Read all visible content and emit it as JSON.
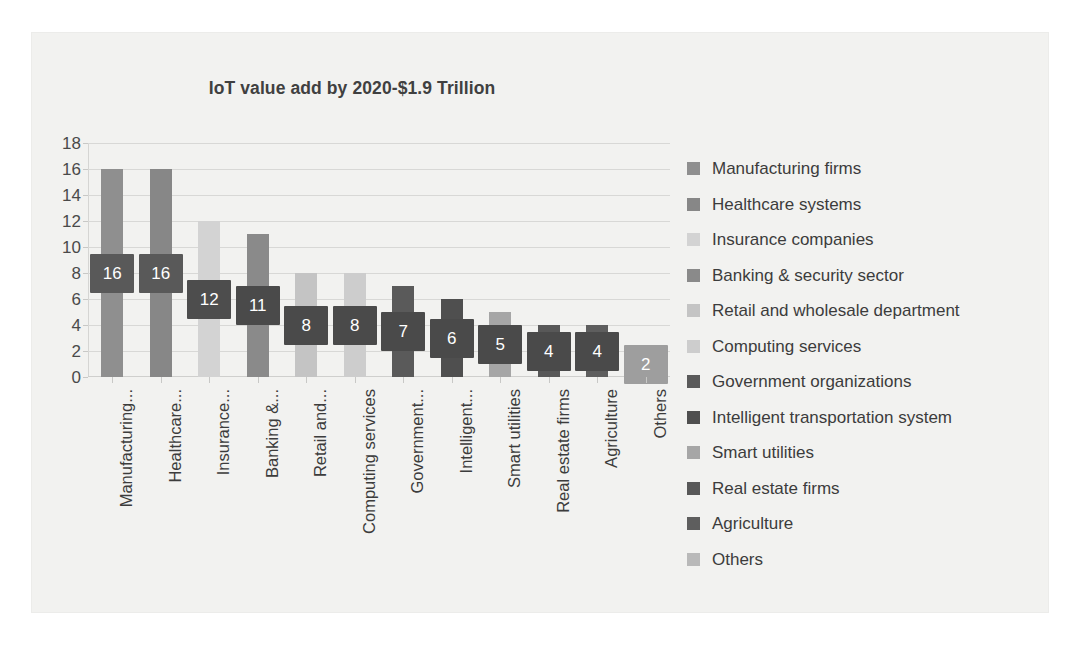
{
  "chart_data": {
    "type": "bar",
    "title": "IoT value add by 2020-$1.9 Trillion",
    "xlabel": "",
    "ylabel": "",
    "ylim": [
      0,
      18
    ],
    "y_ticks": [
      0,
      2,
      4,
      6,
      8,
      10,
      12,
      14,
      16,
      18
    ],
    "grid": true,
    "legend_position": "right",
    "categories": [
      "Manufacturing...",
      "Healthcare...",
      "Insurance...",
      "Banking &...",
      "Retail and...",
      "Computing services",
      "Government...",
      "Intelligent...",
      "Smart utilities",
      "Real estate firms",
      "Agriculture",
      "Others"
    ],
    "values": [
      16,
      16,
      12,
      11,
      8,
      8,
      7,
      6,
      5,
      4,
      4,
      2
    ],
    "data_labels": [
      "16",
      "16",
      "12",
      "11",
      "8",
      "8",
      "7",
      "6",
      "5",
      "4",
      "4",
      "2"
    ],
    "bar_colors": [
      "#8f8f8f",
      "#878787",
      "#d3d3d3",
      "#8a8a8a",
      "#c4c4c4",
      "#cdcdcd",
      "#5a5a5a",
      "#4f4f4f",
      "#a6a6a6",
      "#585858",
      "#5e5e5e",
      "#b9b9b9"
    ],
    "label_box_colors": [
      "#595959",
      "#595959",
      "#4d4d4d",
      "#4a4a4a",
      "#4a4a4a",
      "#4a4a4a",
      "#4a4a4a",
      "#4a4a4a",
      "#4a4a4a",
      "#4a4a4a",
      "#4a4a4a",
      "#9e9e9e"
    ],
    "legend": [
      "Manufacturing firms",
      "Healthcare systems",
      "Insurance companies",
      "Banking & security sector",
      "Retail and wholesale department",
      "Computing services",
      "Government organizations",
      "Intelligent transportation system",
      "Smart utilities",
      "Real estate firms",
      "Agriculture",
      "Others"
    ],
    "legend_colors": [
      "#8f8f8f",
      "#878787",
      "#d3d3d3",
      "#8a8a8a",
      "#c4c4c4",
      "#cdcdcd",
      "#5a5a5a",
      "#4f4f4f",
      "#a6a6a6",
      "#585858",
      "#5e5e5e",
      "#b9b9b9"
    ]
  },
  "colors": {
    "figure_background": "#f2f2f0",
    "grid": "#d8d8d6",
    "text": "#3c3c3c",
    "title": "#404040"
  }
}
